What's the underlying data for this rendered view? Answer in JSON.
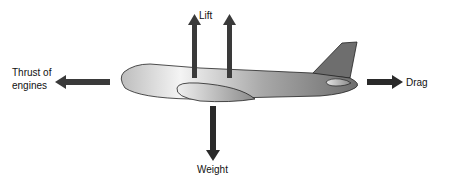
{
  "diagram": {
    "forces": {
      "lift": {
        "label": "Lift",
        "direction": "up"
      },
      "weight": {
        "label": "Weight",
        "direction": "down"
      },
      "thrust": {
        "label_line1": "Thrust of",
        "label_line2": "engines",
        "direction": "left"
      },
      "drag": {
        "label": "Drag",
        "direction": "right"
      }
    },
    "colors": {
      "arrow": "#333333",
      "fuselage_light": "#f2f2f2",
      "fuselage_dark": "#7a7a7a",
      "outline": "#222222"
    }
  }
}
